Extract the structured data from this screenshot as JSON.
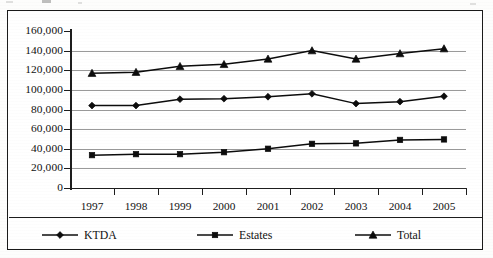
{
  "chart_data": {
    "type": "line",
    "title": "",
    "subtitle": "",
    "xlabel": "",
    "ylabel": "",
    "categories": [
      "1997",
      "1998",
      "1999",
      "2000",
      "2001",
      "2002",
      "2003",
      "2004",
      "2005"
    ],
    "ylim": [
      0,
      160000
    ],
    "ytick_step": 20000,
    "ytick_labels": [
      "160,000",
      "140,000",
      "120,000",
      "100,000",
      "80,000",
      "60,000",
      "40,000",
      "20,000",
      "0"
    ],
    "ytick_values": [
      160000,
      140000,
      120000,
      100000,
      80000,
      60000,
      40000,
      20000,
      0
    ],
    "grid": true,
    "grid_axis": "y",
    "legend_position": "bottom",
    "series": [
      {
        "name": "KTDA",
        "marker": "diamond",
        "color": "#0c0c0c",
        "values": [
          84000,
          84000,
          90500,
          91000,
          93000,
          96000,
          86000,
          88000,
          93500
        ]
      },
      {
        "name": "Estates",
        "marker": "square",
        "color": "#0c0c0c",
        "values": [
          33500,
          34500,
          34500,
          36500,
          40000,
          45000,
          45500,
          49000,
          49500
        ]
      },
      {
        "name": "Total",
        "marker": "triangle",
        "color": "#0c0c0c",
        "values": [
          117000,
          118000,
          124000,
          126000,
          131500,
          140000,
          131500,
          137000,
          142000
        ]
      }
    ]
  },
  "legend": {
    "items": [
      {
        "label": "KTDA",
        "marker": "diamond"
      },
      {
        "label": "Estates",
        "marker": "square"
      },
      {
        "label": "Total",
        "marker": "triangle"
      }
    ]
  }
}
